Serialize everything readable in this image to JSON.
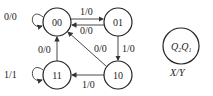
{
  "diagram": {
    "type": "state-transition-diagram",
    "states": [
      {
        "id": "s00",
        "label": "00"
      },
      {
        "id": "s01",
        "label": "01"
      },
      {
        "id": "s11",
        "label": "11"
      },
      {
        "id": "s10",
        "label": "10"
      }
    ],
    "transitions": [
      {
        "from": "00",
        "to": "00",
        "label": "0/0"
      },
      {
        "from": "00",
        "to": "01",
        "label": "1/0"
      },
      {
        "from": "01",
        "to": "00",
        "label": "0/0"
      },
      {
        "from": "01",
        "to": "10",
        "label": "1/0"
      },
      {
        "from": "10",
        "to": "00",
        "label": "0/0"
      },
      {
        "from": "10",
        "to": "11",
        "label": "1/0"
      },
      {
        "from": "11",
        "to": "00",
        "label": "0/0"
      },
      {
        "from": "11",
        "to": "11",
        "label": "1/1"
      }
    ],
    "legend": {
      "state_label_q2": "Q",
      "sub2": "2",
      "state_label_q1": "Q",
      "sub1": "1",
      "io_label": "X/Y"
    }
  }
}
